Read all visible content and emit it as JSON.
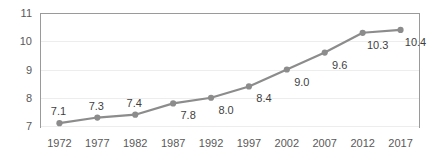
{
  "chart_data": {
    "type": "line",
    "title": "",
    "subtitle": "",
    "xlabel": "",
    "ylabel": "",
    "categories": [
      "1972",
      "1977",
      "1982",
      "1987",
      "1992",
      "1997",
      "2002",
      "2007",
      "2012",
      "2017"
    ],
    "values": [
      7.1,
      7.3,
      7.4,
      7.8,
      8.0,
      8.4,
      9.0,
      9.6,
      10.3,
      10.4
    ],
    "data_labels": [
      "7.1",
      "7.3",
      "7.4",
      "7.8",
      "8.0",
      "8.4",
      "9.0",
      "9.6",
      "10.3",
      "10.4"
    ],
    "data_label_positions": [
      "above",
      "above",
      "above",
      "below",
      "below",
      "below",
      "below",
      "below",
      "below",
      "below"
    ],
    "ylim": [
      7,
      11
    ],
    "yticks": [
      7,
      8,
      9,
      10,
      11
    ],
    "ytick_labels": [
      "7",
      "8",
      "9",
      "10",
      "11"
    ],
    "xtick_labels": [
      "1972",
      "1977",
      "1982",
      "1987",
      "1992",
      "1997",
      "2002",
      "2007",
      "2012",
      "2017"
    ],
    "grid": "horizontal-faint",
    "legend": "none",
    "series": [
      {
        "name": "",
        "values": [
          7.1,
          7.3,
          7.4,
          7.8,
          8.0,
          8.4,
          9.0,
          9.6,
          10.3,
          10.4
        ],
        "line_color": "#8C8C8C",
        "marker_color": "#8C8C8C",
        "marker": "circle"
      }
    ],
    "colors": {
      "line": "#8C8C8C",
      "marker": "#8C8C8C",
      "axis": "#9A9A9A",
      "grid": "#EDEDED",
      "tick_text": "#595959",
      "label_text": "#3F3F3F",
      "background": "#FFFFFF"
    }
  }
}
